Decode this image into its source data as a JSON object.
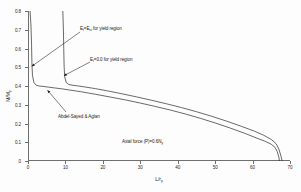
{
  "chart_data": {
    "type": "line",
    "title": "",
    "xlabel": "L/r_y",
    "ylabel": "M/M_p",
    "xlim": [
      0,
      70
    ],
    "ylim": [
      0,
      0.8
    ],
    "xticks": [
      0,
      10,
      20,
      30,
      40,
      50,
      60,
      70
    ],
    "yticks": [
      0,
      0.1,
      0.2,
      0.3,
      0.4,
      0.5,
      0.6,
      0.7,
      0.8
    ],
    "xtick_labels": [
      "0",
      "10",
      "20",
      "30",
      "40",
      "50",
      "60",
      "70"
    ],
    "ytick_labels": [
      "0",
      "0.1",
      "0.2",
      "0.3",
      "0.4",
      "0.5",
      "0.6",
      "0.7",
      "0.8"
    ],
    "grid": false,
    "legend": "none",
    "series": [
      {
        "name": "E_t=E_st for yield region",
        "comment": "sharp vertical spike near L/ry = 1, plateau ~0.40, gradual decline, sharp drop at ~67",
        "x": [
          0.55,
          0.8,
          0.95,
          1.05,
          1.2,
          1.6,
          2.2,
          3.0,
          4.0,
          5.5,
          7.0,
          9.0,
          11.0,
          14.0,
          18.0,
          22.0,
          26.0,
          30.0,
          34.0,
          38.0,
          42.0,
          46.0,
          50.0,
          54.0,
          58.0,
          61.0,
          63.5,
          65.0,
          66.0,
          66.6,
          67.0,
          67.2
        ],
        "y": [
          0.8,
          0.72,
          0.62,
          0.52,
          0.455,
          0.418,
          0.404,
          0.4,
          0.398,
          0.394,
          0.39,
          0.385,
          0.379,
          0.37,
          0.356,
          0.341,
          0.326,
          0.309,
          0.291,
          0.272,
          0.251,
          0.228,
          0.203,
          0.176,
          0.147,
          0.123,
          0.104,
          0.089,
          0.073,
          0.05,
          0.022,
          0.0
        ]
      },
      {
        "name": "E_t=0.0 for yield region",
        "comment": "sharp vertical spike near L/ry = 9.5, merges with other curve beyond ~14",
        "x": [
          9.3,
          9.45,
          9.55,
          9.65,
          9.8,
          10.2,
          10.9,
          12.0,
          13.5,
          15.5,
          18.0,
          21.0,
          25.0,
          29.0,
          33.0,
          37.0,
          41.0,
          45.0,
          49.0,
          53.0,
          57.0,
          60.5,
          63.0,
          65.0,
          66.3,
          67.0,
          67.6,
          67.9
        ],
        "y": [
          0.8,
          0.71,
          0.6,
          0.505,
          0.449,
          0.419,
          0.408,
          0.404,
          0.4,
          0.394,
          0.386,
          0.375,
          0.359,
          0.342,
          0.324,
          0.305,
          0.285,
          0.263,
          0.239,
          0.213,
          0.185,
          0.159,
          0.137,
          0.115,
          0.092,
          0.065,
          0.026,
          0.0
        ]
      }
    ],
    "annotations": [
      {
        "id": "et-est",
        "text": "E<sub>t</sub>=E<sub>st</sub> for yield region",
        "plain": "E_t=E_st for yield region",
        "arrow_to_x": 1.0,
        "arrow_to_y": 0.505
      },
      {
        "id": "et-zero",
        "text": "E<sub>t</sub>=0.0 for yield region",
        "plain": "E_t=0.0 for yield region",
        "arrow_to_x": 9.6,
        "arrow_to_y": 0.455
      },
      {
        "id": "abdel-sayed-aglan",
        "text": "Abdel-Sayed &amp; Aglan",
        "plain": "Abdel-Sayed & Aglan",
        "arrow_to_x": 5.2,
        "arrow_to_y": 0.378
      },
      {
        "id": "axial-force",
        "text": "Axial force (P)=0.6N<sub>y</sub>",
        "plain": "Axial force (P)=0.6N_y",
        "arrow_to_x": null,
        "arrow_to_y": null
      }
    ],
    "colors": {
      "curve": "#2a2a2a",
      "axis": "#6f6f6f",
      "text": "#1a1a1a",
      "background": "#fdfdfd"
    }
  }
}
